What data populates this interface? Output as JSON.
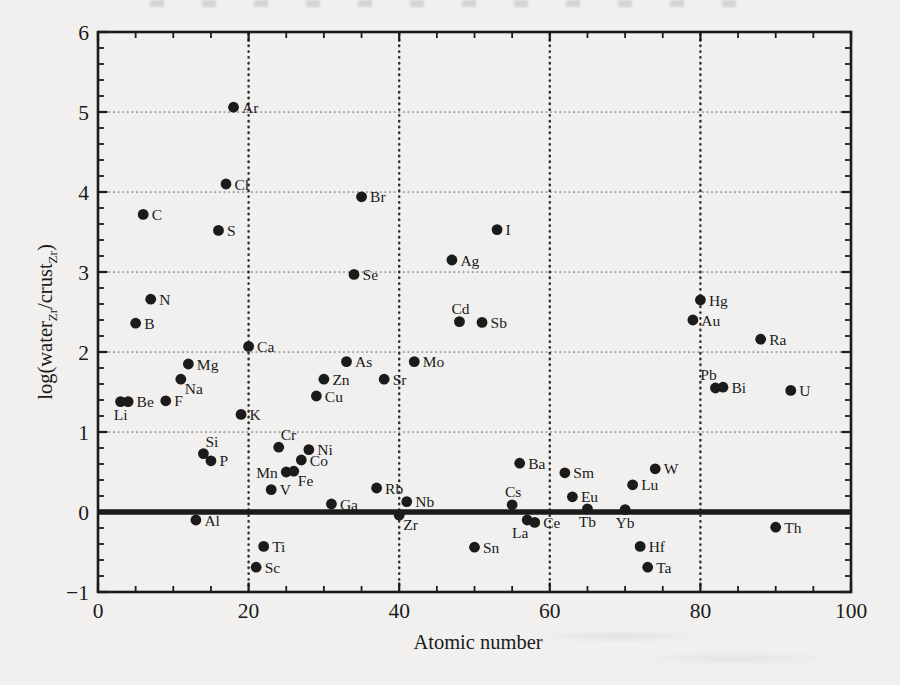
{
  "figure": {
    "background": "#f1f0ee",
    "ink": "#1b1b1b",
    "h_grid_color": "#8a8a8a",
    "v_grid_color": "#2e2e2e"
  },
  "chart_data": {
    "type": "scatter",
    "title": "",
    "xlabel": "Atomic number",
    "ylabel": "log(water_Zr/crust_Zr)",
    "ylabel_parts": [
      {
        "text": "log(water",
        "sub": false
      },
      {
        "text": "Zr",
        "sub": true
      },
      {
        "text": "/crust",
        "sub": false
      },
      {
        "text": "Zr",
        "sub": true
      },
      {
        "text": ")",
        "sub": false
      }
    ],
    "xlim": [
      0,
      100
    ],
    "ylim": [
      -1,
      6
    ],
    "x_major_ticks": [
      0,
      20,
      40,
      60,
      80,
      100
    ],
    "x_minor_step": 5,
    "y_major_ticks": [
      6,
      5,
      4,
      3,
      2,
      1,
      0,
      -1
    ],
    "y_minor_step": 0.2,
    "h_dotted_gridlines": [
      1,
      2,
      3,
      4,
      5
    ],
    "v_dotted_gridlines": [
      20,
      40,
      60,
      80
    ],
    "zero_line_y": 0,
    "grid": "dotted",
    "legend": "none",
    "marker": "filled-circle",
    "points": [
      {
        "el": "Li",
        "z": 3,
        "v": 1.38,
        "pos": "below"
      },
      {
        "el": "Be",
        "z": 4,
        "v": 1.38,
        "pos": "right"
      },
      {
        "el": "B",
        "z": 5,
        "v": 2.36,
        "pos": "right"
      },
      {
        "el": "C",
        "z": 6,
        "v": 3.72,
        "pos": "right"
      },
      {
        "el": "N",
        "z": 7,
        "v": 2.66,
        "pos": "right"
      },
      {
        "el": "F",
        "z": 9,
        "v": 1.39,
        "pos": "right"
      },
      {
        "el": "Na",
        "z": 11,
        "v": 1.66,
        "pos": "below-right"
      },
      {
        "el": "Mg",
        "z": 12,
        "v": 1.85,
        "pos": "right"
      },
      {
        "el": "Al",
        "z": 13,
        "v": -0.1,
        "pos": "right"
      },
      {
        "el": "Si",
        "z": 14,
        "v": 0.73,
        "pos": "above-right"
      },
      {
        "el": "P",
        "z": 15,
        "v": 0.64,
        "pos": "right"
      },
      {
        "el": "S",
        "z": 16,
        "v": 3.52,
        "pos": "right"
      },
      {
        "el": "Cl",
        "z": 17,
        "v": 4.1,
        "pos": "right"
      },
      {
        "el": "Ar",
        "z": 18,
        "v": 5.06,
        "pos": "right"
      },
      {
        "el": "K",
        "z": 19,
        "v": 1.22,
        "pos": "right"
      },
      {
        "el": "Ca",
        "z": 20,
        "v": 2.07,
        "pos": "right"
      },
      {
        "el": "Sc",
        "z": 21,
        "v": -0.69,
        "pos": "right"
      },
      {
        "el": "Ti",
        "z": 22,
        "v": -0.43,
        "pos": "right"
      },
      {
        "el": "V",
        "z": 23,
        "v": 0.28,
        "pos": "right"
      },
      {
        "el": "Cr",
        "z": 24,
        "v": 0.81,
        "pos": "above-right"
      },
      {
        "el": "Mn",
        "z": 25,
        "v": 0.5,
        "pos": "left"
      },
      {
        "el": "Fe",
        "z": 26,
        "v": 0.51,
        "pos": "below-right"
      },
      {
        "el": "Co",
        "z": 27,
        "v": 0.65,
        "pos": "right"
      },
      {
        "el": "Ni",
        "z": 28,
        "v": 0.78,
        "pos": "right"
      },
      {
        "el": "Cu",
        "z": 29,
        "v": 1.45,
        "pos": "right"
      },
      {
        "el": "Zn",
        "z": 30,
        "v": 1.66,
        "pos": "right"
      },
      {
        "el": "Ga",
        "z": 31,
        "v": 0.1,
        "pos": "right"
      },
      {
        "el": "As",
        "z": 33,
        "v": 1.88,
        "pos": "right"
      },
      {
        "el": "Se",
        "z": 34,
        "v": 2.97,
        "pos": "right"
      },
      {
        "el": "Br",
        "z": 35,
        "v": 3.94,
        "pos": "right"
      },
      {
        "el": "Rb",
        "z": 37,
        "v": 0.3,
        "pos": "right"
      },
      {
        "el": "Sr",
        "z": 38,
        "v": 1.66,
        "pos": "right"
      },
      {
        "el": "Zr",
        "z": 40,
        "v": -0.04,
        "pos": "below-right"
      },
      {
        "el": "Nb",
        "z": 41,
        "v": 0.13,
        "pos": "right"
      },
      {
        "el": "Mo",
        "z": 42,
        "v": 1.88,
        "pos": "right"
      },
      {
        "el": "Ag",
        "z": 47,
        "v": 3.15,
        "pos": "right"
      },
      {
        "el": "Cd",
        "z": 48,
        "v": 2.38,
        "pos": "above"
      },
      {
        "el": "Sn",
        "z": 50,
        "v": -0.44,
        "pos": "right"
      },
      {
        "el": "Sb",
        "z": 51,
        "v": 2.37,
        "pos": "right"
      },
      {
        "el": "I",
        "z": 53,
        "v": 3.53,
        "pos": "right"
      },
      {
        "el": "Cs",
        "z": 55,
        "v": 0.09,
        "pos": "above"
      },
      {
        "el": "Ba",
        "z": 56,
        "v": 0.61,
        "pos": "right"
      },
      {
        "el": "La",
        "z": 57,
        "v": -0.1,
        "pos": "below-left"
      },
      {
        "el": "Ce",
        "z": 58,
        "v": -0.13,
        "pos": "right"
      },
      {
        "el": "Sm",
        "z": 62,
        "v": 0.49,
        "pos": "right"
      },
      {
        "el": "Eu",
        "z": 63,
        "v": 0.19,
        "pos": "right"
      },
      {
        "el": "Tb",
        "z": 65,
        "v": 0.04,
        "pos": "below"
      },
      {
        "el": "Yb",
        "z": 70,
        "v": 0.03,
        "pos": "below"
      },
      {
        "el": "Lu",
        "z": 71,
        "v": 0.34,
        "pos": "right"
      },
      {
        "el": "Hf",
        "z": 72,
        "v": -0.43,
        "pos": "right"
      },
      {
        "el": "Ta",
        "z": 73,
        "v": -0.69,
        "pos": "right"
      },
      {
        "el": "W",
        "z": 74,
        "v": 0.54,
        "pos": "right"
      },
      {
        "el": "Au",
        "z": 79,
        "v": 2.4,
        "pos": "right"
      },
      {
        "el": "Hg",
        "z": 80,
        "v": 2.65,
        "pos": "right"
      },
      {
        "el": "Pb",
        "z": 82,
        "v": 1.55,
        "pos": "above-left"
      },
      {
        "el": "Bi",
        "z": 83,
        "v": 1.56,
        "pos": "right"
      },
      {
        "el": "Ra",
        "z": 88,
        "v": 2.16,
        "pos": "right"
      },
      {
        "el": "Th",
        "z": 90,
        "v": -0.19,
        "pos": "right"
      },
      {
        "el": "U",
        "z": 92,
        "v": 1.52,
        "pos": "right"
      }
    ]
  }
}
